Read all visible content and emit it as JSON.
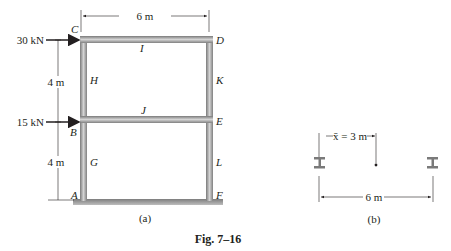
{
  "figure": {
    "caption": "Fig. 7–16",
    "part_a": {
      "sublabel": "(a)",
      "span_dimension": "6 m",
      "loads": [
        {
          "label": "30 kN",
          "at": "C"
        },
        {
          "label": "15 kN",
          "at": "B"
        }
      ],
      "height_dimensions": [
        "4 m",
        "4 m"
      ],
      "joint_labels": {
        "A": "A",
        "B": "B",
        "C": "C",
        "D": "D",
        "E": "E",
        "F": "F",
        "G": "G",
        "H": "H",
        "I": "I",
        "J": "J",
        "K": "K",
        "L": "L"
      }
    },
    "part_b": {
      "sublabel": "(b)",
      "centroid_dimension": "x̄ = 3 m",
      "span_dimension": "6 m"
    }
  },
  "colors": {
    "member_fill": "#9a9a9a",
    "member_edge": "#6b6b6b",
    "ink": "#231f20",
    "ground": "#8c8c8c"
  }
}
